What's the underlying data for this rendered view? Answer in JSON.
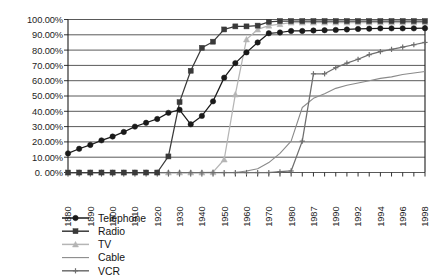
{
  "chart_data": {
    "type": "line",
    "title": "",
    "subtitle": "",
    "xlabel": "",
    "ylabel": "",
    "grid": true,
    "legend_position": "bottom-left",
    "ylim": [
      0,
      100
    ],
    "ytick_labels": [
      "100.00%",
      "90.00%",
      "80.00%",
      "70.00%",
      "60.00%",
      "50.00%",
      "40.00%",
      "30.00%",
      "20.00%",
      "10.00%",
      "0. 00%"
    ],
    "ytick_values": [
      100,
      90,
      80,
      70,
      60,
      50,
      40,
      30,
      20,
      10,
      0
    ],
    "xtick_labels": [
      "1880",
      "1890",
      "1900",
      "1910",
      "1920",
      "1930",
      "1940",
      "1950",
      "1960",
      "1970",
      "1980",
      "1987",
      "1990",
      "1992",
      "1994",
      "1996",
      "1998"
    ],
    "x": [
      "1880",
      "1885",
      "1890",
      "1895",
      "1900",
      "1905",
      "1910",
      "1915",
      "1920",
      "1925",
      "1930",
      "1935",
      "1940",
      "1945",
      "1950",
      "1955",
      "1960",
      "1965",
      "1970",
      "1975",
      "1980",
      "1985",
      "1987",
      "1988",
      "1990",
      "1991",
      "1992",
      "1993",
      "1994",
      "1995",
      "1996",
      "1997",
      "1998"
    ],
    "series": [
      {
        "name": "Telephone",
        "color": "#1a1a1a",
        "marker": "circle",
        "values": [
          12.5,
          15.5,
          18.0,
          21.0,
          23.5,
          26.5,
          30.0,
          32.5,
          35.0,
          39.0,
          41.0,
          31.5,
          37.0,
          46.5,
          62.0,
          71.5,
          78.5,
          85.0,
          91.0,
          91.5,
          92.5,
          92.5,
          92.8,
          93.0,
          93.2,
          93.5,
          93.8,
          94.0,
          94.2,
          94.2,
          94.2,
          94.2,
          94.3
        ]
      },
      {
        "name": "Radio",
        "color": "#3a3a3a",
        "marker": "square",
        "values": [
          0.0,
          0.0,
          0.0,
          0.0,
          0.0,
          0.0,
          0.0,
          0.0,
          0.0,
          10.5,
          46.0,
          66.5,
          81.5,
          85.5,
          93.5,
          95.5,
          95.5,
          96.0,
          98.5,
          99.0,
          99.0,
          99.0,
          99.0,
          99.0,
          99.0,
          99.0,
          99.0,
          99.0,
          99.0,
          99.0,
          99.0,
          99.0,
          99.0
        ]
      },
      {
        "name": "TV",
        "color": "#b5b5b5",
        "marker": "triangle",
        "values": [
          0.0,
          0.0,
          0.0,
          0.0,
          0.0,
          0.0,
          0.0,
          0.0,
          0.0,
          0.0,
          0.0,
          0.0,
          0.0,
          0.2,
          8.5,
          51.0,
          87.0,
          93.5,
          96.0,
          97.0,
          98.0,
          98.0,
          98.0,
          98.0,
          98.0,
          98.0,
          98.0,
          98.0,
          98.0,
          98.0,
          98.0,
          98.0,
          98.0
        ]
      },
      {
        "name": "Cable",
        "color": "#8a8a8a",
        "marker": "none",
        "values": [
          0.0,
          0.0,
          0.0,
          0.0,
          0.0,
          0.0,
          0.0,
          0.0,
          0.0,
          0.0,
          0.0,
          0.0,
          0.0,
          0.0,
          0.0,
          0.0,
          1.0,
          2.5,
          6.5,
          12.5,
          20.5,
          42.5,
          48.5,
          51.5,
          55.0,
          57.0,
          58.5,
          60.0,
          61.5,
          62.5,
          64.0,
          65.0,
          66.0
        ]
      },
      {
        "name": "VCR",
        "color": "#6e6e6e",
        "marker": "cross",
        "values": [
          0.0,
          0.0,
          0.0,
          0.0,
          0.0,
          0.0,
          0.0,
          0.0,
          0.0,
          0.0,
          0.0,
          0.0,
          0.0,
          0.0,
          0.0,
          0.0,
          0.0,
          0.0,
          0.0,
          0.5,
          1.0,
          20.5,
          64.5,
          64.5,
          68.5,
          71.5,
          74.0,
          77.0,
          79.0,
          80.5,
          82.0,
          83.5,
          85.0
        ]
      }
    ]
  },
  "legend": {
    "items": [
      {
        "label": "Telephone"
      },
      {
        "label": "Radio"
      },
      {
        "label": "TV"
      },
      {
        "label": "Cable"
      },
      {
        "label": "VCR"
      }
    ]
  }
}
